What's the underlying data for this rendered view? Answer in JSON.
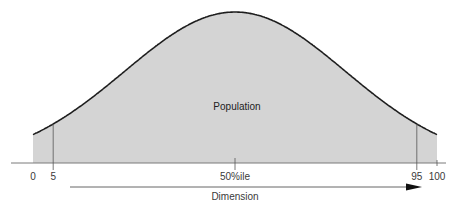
{
  "chart_data": {
    "type": "area",
    "title": "",
    "distribution": "normal",
    "mean_percentile": 50,
    "x_range": [
      0,
      100
    ],
    "ticks": [
      {
        "value": 0,
        "label": "0",
        "guide": false
      },
      {
        "value": 5,
        "label": "5",
        "guide": true
      },
      {
        "value": 50,
        "label": "50%ile",
        "guide": true
      },
      {
        "value": 95,
        "label": "95",
        "guide": true
      },
      {
        "value": 100,
        "label": "100",
        "guide": false
      }
    ],
    "area_label": "Population",
    "xlabel": "Dimension",
    "axis_arrow": true,
    "colors": {
      "fill": "#d4d4d4",
      "curve": "#1e1e1e",
      "axis": "#7a7a7a",
      "arrow": "#111111"
    }
  }
}
